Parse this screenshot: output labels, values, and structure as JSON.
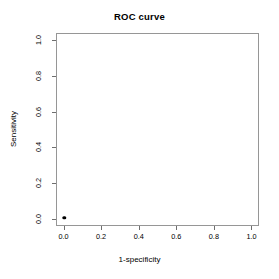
{
  "chart_data": {
    "type": "scatter",
    "title": "ROC curve",
    "xlabel": "1-specificity",
    "ylabel": "Sensitivity",
    "xlim": [
      -0.04,
      1.04
    ],
    "ylim": [
      -0.04,
      1.04
    ],
    "grid": false,
    "legend": null,
    "x_ticks": [
      0.0,
      0.2,
      0.4,
      0.6,
      0.8,
      1.0
    ],
    "y_ticks": [
      0.0,
      0.2,
      0.4,
      0.6,
      0.8,
      1.0
    ],
    "x_ticklabels": [
      "0.0",
      "0.2",
      "0.4",
      "0.6",
      "0.8",
      "1.0"
    ],
    "y_ticklabels": [
      "0.0",
      "0.2",
      "0.4",
      "0.6",
      "0.8",
      "1.0"
    ],
    "series": [
      {
        "name": "ROC points",
        "marker": "filled-circle",
        "color": "#000000",
        "points": [
          {
            "x": 0.0,
            "y": 0.0
          }
        ]
      }
    ]
  },
  "plot": {
    "box_color": "#969696",
    "tick_color": "#6e6e6e",
    "background": "#ffffff"
  }
}
